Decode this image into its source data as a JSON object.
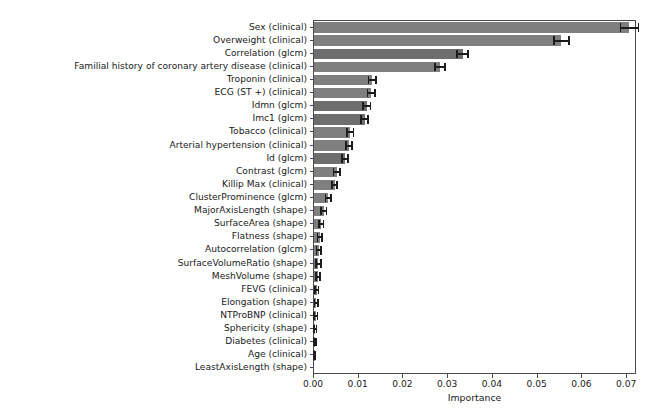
{
  "chart_data": {
    "type": "bar",
    "orientation": "horizontal",
    "title": "",
    "xlabel": "Importance",
    "ylabel": "",
    "xlim": [
      0.0,
      0.0722
    ],
    "xticks": [
      0.0,
      0.01,
      0.02,
      0.03,
      0.04,
      0.05,
      0.06,
      0.07
    ],
    "xticklabels": [
      "0.00",
      "0.01",
      "0.02",
      "0.03",
      "0.04",
      "0.05",
      "0.06",
      "0.07"
    ],
    "grid": false,
    "legend": null,
    "bar_color": "#7f7f7f",
    "error_bar_color": "#1c1c1c",
    "has_error_bars": true,
    "categories": [
      "Sex (clinical)",
      "Overweight (clinical)",
      "Correlation (glcm)",
      "Familial history of coronary artery disease (clinical)",
      "Troponin (clinical)",
      "ECG (ST +) (clinical)",
      "Idmn (glcm)",
      "Imc1 (glcm)",
      "Tobacco (clinical)",
      "Arterial hypertension (clinical)",
      "Id (glcm)",
      "Contrast (glcm)",
      "Killip Max (clinical)",
      "ClusterProminence (glcm)",
      "MajorAxisLength (shape)",
      "SurfaceArea (shape)",
      "Flatness (shape)",
      "Autocorrelation (glcm)",
      "SurfaceVolumeRatio (shape)",
      "MeshVolume (shape)",
      "FEVG (clinical)",
      "Elongation (shape)",
      "NTProBNP (clinical)",
      "Sphericity (shape)",
      "Diabetes (clinical)",
      "Age (clinical)",
      "LeastAxisLength (shape)"
    ],
    "values": [
      0.0705,
      0.0553,
      0.0332,
      0.0282,
      0.013,
      0.0128,
      0.0118,
      0.0113,
      0.0081,
      0.0078,
      0.0069,
      0.0051,
      0.0046,
      0.0032,
      0.0022,
      0.0016,
      0.0013,
      0.0011,
      0.001,
      0.0009,
      0.0006,
      0.0005,
      0.0004,
      0.0003,
      0.0002,
      0.0001,
      0.0
    ],
    "errors": [
      0.002,
      0.0017,
      0.0012,
      0.0011,
      0.0008,
      0.0008,
      0.0008,
      0.0008,
      0.0007,
      0.0007,
      0.0007,
      0.0007,
      0.0006,
      0.0006,
      0.0006,
      0.0005,
      0.0005,
      0.0005,
      0.0005,
      0.0005,
      0.0004,
      0.0004,
      0.0004,
      0.0003,
      0.0003,
      0.0002,
      0.0
    ]
  }
}
